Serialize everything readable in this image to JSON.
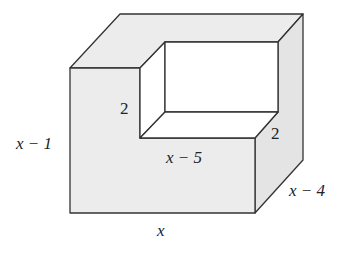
{
  "diagram": {
    "type": "3d-solid-with-notch",
    "colors": {
      "face_fill": "#ececec",
      "side_fill": "#e4e4e4",
      "opening_fill": "#ffffff",
      "stroke": "#333333"
    },
    "labels": {
      "height": "x − 1",
      "width": "x",
      "depth": "x − 4",
      "notch_depth_left": "2",
      "notch_depth_right": "2",
      "notch_width": "x − 5"
    }
  }
}
